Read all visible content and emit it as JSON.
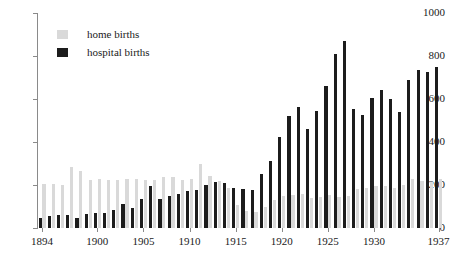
{
  "chart_data": {
    "type": "bar",
    "title": "",
    "subtitle": "",
    "xlabel": "",
    "ylabel": "",
    "ylim": [
      0,
      1000
    ],
    "yticks": [
      0,
      200,
      400,
      600,
      800,
      1000
    ],
    "xticks": [
      1894,
      1900,
      1905,
      1910,
      1915,
      1920,
      1925,
      1930,
      1937
    ],
    "grid": false,
    "legend_position": "top-left",
    "categories": [
      1894,
      1895,
      1896,
      1897,
      1898,
      1899,
      1900,
      1901,
      1902,
      1903,
      1904,
      1905,
      1906,
      1907,
      1908,
      1909,
      1910,
      1911,
      1912,
      1913,
      1914,
      1915,
      1916,
      1917,
      1918,
      1919,
      1920,
      1921,
      1922,
      1923,
      1924,
      1925,
      1926,
      1927,
      1928,
      1929,
      1930,
      1931,
      1932,
      1933,
      1934,
      1935,
      1936,
      1937
    ],
    "series": [
      {
        "name": "hospital births",
        "color": "#1c1c1c",
        "values": [
          45,
          55,
          60,
          60,
          45,
          65,
          70,
          70,
          85,
          110,
          95,
          135,
          195,
          135,
          150,
          160,
          170,
          175,
          200,
          215,
          210,
          185,
          180,
          175,
          250,
          310,
          425,
          520,
          565,
          460,
          545,
          660,
          810,
          870,
          555,
          525,
          605,
          640,
          600,
          540,
          690,
          735,
          725,
          750
        ]
      },
      {
        "name": "home births",
        "color": "#d9d9d9",
        "values": [
          205,
          205,
          200,
          285,
          265,
          225,
          230,
          225,
          225,
          230,
          230,
          225,
          225,
          235,
          235,
          225,
          230,
          300,
          240,
          220,
          185,
          105,
          80,
          75,
          100,
          130,
          150,
          155,
          160,
          140,
          145,
          155,
          145,
          150,
          180,
          185,
          195,
          195,
          185,
          200,
          230,
          220,
          215,
          230
        ]
      }
    ]
  },
  "legend": {
    "items": [
      {
        "label": "home births",
        "swatch": "stipple"
      },
      {
        "label": "hospital births",
        "swatch": "solid"
      }
    ]
  },
  "axes": {
    "y_tick_labels": [
      "0",
      "200",
      "400",
      "600",
      "800",
      "1000"
    ],
    "x_tick_labels": [
      "1894",
      "1900",
      "1905",
      "1910",
      "1915",
      "1920",
      "1925",
      "1930",
      "1937"
    ]
  }
}
